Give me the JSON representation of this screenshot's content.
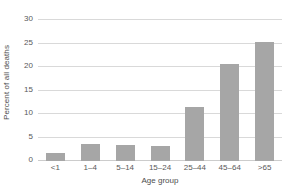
{
  "chart_data": {
    "type": "bar",
    "title": "",
    "xlabel": "Age group",
    "ylabel": "Percent of all deaths",
    "categories": [
      "<1",
      "1–4",
      "5–14",
      "15–24",
      "25–44",
      "45–64",
      ">65"
    ],
    "values": [
      1.7,
      3.7,
      3.5,
      3.1,
      11.4,
      20.6,
      25.3
    ],
    "yticks": [
      0,
      5,
      10,
      15,
      20,
      25,
      30
    ],
    "ytick_labels": [
      "0",
      "5",
      "10",
      "15",
      "20",
      "25",
      "30"
    ],
    "ylim": [
      0,
      30
    ],
    "grid": true,
    "legend": false,
    "bar_color": "#a6a6a6",
    "grid_color": "#d9d9d9",
    "text_color": "#4d4d4d"
  }
}
